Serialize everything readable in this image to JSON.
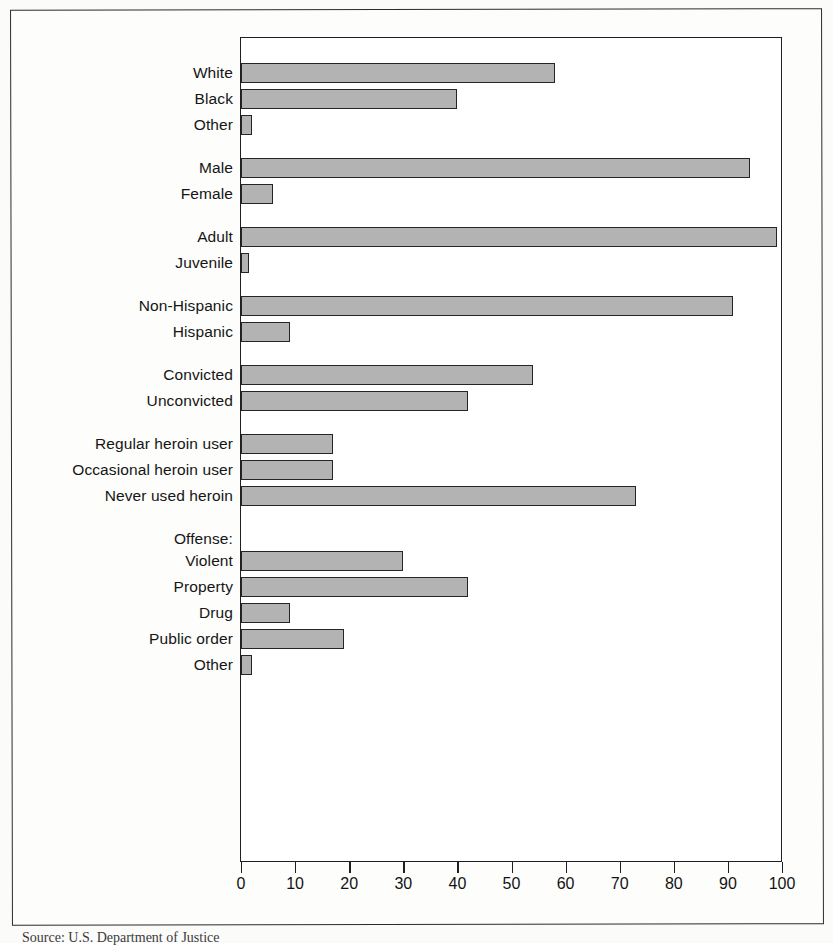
{
  "chart_data": {
    "type": "bar",
    "orientation": "horizontal",
    "title": "",
    "xlabel": "",
    "ylabel": "",
    "xlim": [
      0,
      100
    ],
    "grid": false,
    "legend": false,
    "tick_labels": [
      "0",
      "10",
      "20",
      "30",
      "40",
      "50",
      "60",
      "70",
      "80",
      "90",
      "100"
    ],
    "tick_values": [
      0,
      10,
      20,
      30,
      40,
      50,
      60,
      70,
      80,
      90,
      100
    ],
    "bar_color": "#b3b3b3",
    "bar_edge_color": "#252525",
    "groups": [
      {
        "name": "race",
        "heading": "",
        "items": [
          {
            "label": "White",
            "value": 58
          },
          {
            "label": "Black",
            "value": 40
          },
          {
            "label": "Other",
            "value": 2
          }
        ]
      },
      {
        "name": "sex",
        "heading": "",
        "items": [
          {
            "label": "Male",
            "value": 94
          },
          {
            "label": "Female",
            "value": 6
          }
        ]
      },
      {
        "name": "age",
        "heading": "",
        "items": [
          {
            "label": "Adult",
            "value": 99
          },
          {
            "label": "Juvenile",
            "value": 1.5
          }
        ]
      },
      {
        "name": "ethnicity",
        "heading": "",
        "items": [
          {
            "label": "Non-Hispanic",
            "value": 91
          },
          {
            "label": "Hispanic",
            "value": 9
          }
        ]
      },
      {
        "name": "conviction-status",
        "heading": "",
        "items": [
          {
            "label": "Convicted",
            "value": 54
          },
          {
            "label": "Unconvicted",
            "value": 42
          }
        ]
      },
      {
        "name": "heroin-use",
        "heading": "",
        "items": [
          {
            "label": "Regular heroin user",
            "value": 17
          },
          {
            "label": "Occasional heroin user",
            "value": 17
          },
          {
            "label": "Never used heroin",
            "value": 73
          }
        ]
      },
      {
        "name": "offense",
        "heading": "Offense:",
        "items": [
          {
            "label": "Violent",
            "value": 30
          },
          {
            "label": "Property",
            "value": 42
          },
          {
            "label": "Drug",
            "value": 9
          },
          {
            "label": "Public order",
            "value": 19
          },
          {
            "label": "Other",
            "value": 2
          }
        ]
      }
    ]
  },
  "caption": {
    "source": "Source: U.S. Department of Justice"
  }
}
